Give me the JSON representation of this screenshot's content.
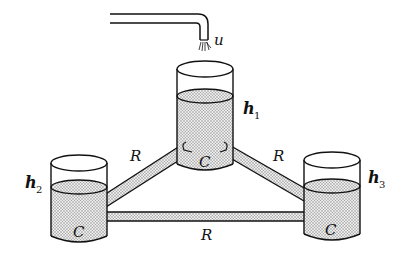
{
  "diagram": {
    "type": "three-tank hydraulic system",
    "input": {
      "label": "u",
      "description": "water inflow from pipe into center tank"
    },
    "tanks": [
      {
        "id": "tank-1",
        "position": "center",
        "level_label": "h",
        "level_subscript": "1",
        "capacitance_label": "C"
      },
      {
        "id": "tank-2",
        "position": "left",
        "level_label": "h",
        "level_subscript": "2",
        "capacitance_label": "C"
      },
      {
        "id": "tank-3",
        "position": "right",
        "level_label": "h",
        "level_subscript": "3",
        "capacitance_label": "C"
      }
    ],
    "pipes": [
      {
        "id": "pipe-1-2",
        "connects": [
          "tank-1",
          "tank-2"
        ],
        "resistance_label": "R"
      },
      {
        "id": "pipe-1-3",
        "connects": [
          "tank-1",
          "tank-3"
        ],
        "resistance_label": "R"
      },
      {
        "id": "pipe-2-3",
        "connects": [
          "tank-2",
          "tank-3"
        ],
        "resistance_label": "R"
      }
    ]
  },
  "colors": {
    "stroke": "#111111",
    "water_fill": "#d9d9d9",
    "background": "#ffffff"
  }
}
